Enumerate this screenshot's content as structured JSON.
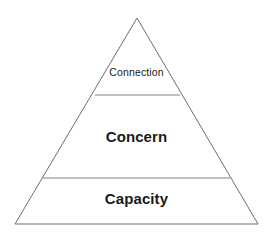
{
  "diagram": {
    "type": "pyramid",
    "background_color": "#ffffff",
    "outline_color": "#6e6e6e",
    "divider_color": "#808080",
    "text_color": "#1a1a1a",
    "apex": {
      "x": 137,
      "y": 18
    },
    "base_left": {
      "x": 15,
      "y": 224
    },
    "base_right": {
      "x": 258,
      "y": 224
    },
    "tiers": [
      {
        "id": "tier-top",
        "label": "Connection",
        "emphasis": "regular",
        "divider_y": 95,
        "divider_x_start": 95,
        "divider_x_end": 180
      },
      {
        "id": "tier-middle",
        "label": "Concern",
        "emphasis": "bold",
        "divider_y": 178,
        "divider_x_start": 43,
        "divider_x_end": 230
      },
      {
        "id": "tier-bottom",
        "label": "Capacity",
        "emphasis": "bold",
        "divider_y": 224,
        "divider_x_start": 15,
        "divider_x_end": 258
      }
    ]
  }
}
